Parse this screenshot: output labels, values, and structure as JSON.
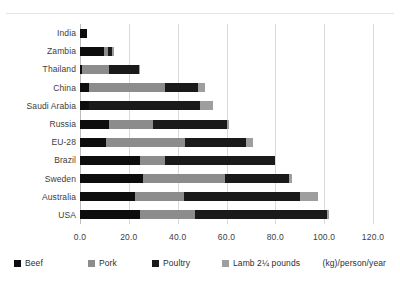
{
  "chart_data": {
    "type": "bar",
    "orientation": "horizontal",
    "stacked": true,
    "title": "",
    "subtitle": "",
    "xlabel": "(kg)/person/year",
    "ylabel": "",
    "xlim": [
      0,
      120
    ],
    "xticks": [
      "0.0",
      "20.0",
      "40.0",
      "60.0",
      "80.0",
      "100.0",
      "120.0"
    ],
    "xtick_values": [
      0,
      20,
      40,
      60,
      80,
      100,
      120
    ],
    "grid": true,
    "legend_position": "bottom",
    "categories": [
      "India",
      "Zambia",
      "Thailand",
      "China",
      "Saudi Arabia",
      "Russia",
      "EU-28",
      "Brazil",
      "Sweden",
      "Australia",
      "USA"
    ],
    "series": [
      {
        "name": "Beef",
        "color": "#0d0d0d",
        "values": [
          3.0,
          9.8,
          0.8,
          3.5,
          3.5,
          12.0,
          10.5,
          24.5,
          26.0,
          22.5,
          24.5
        ]
      },
      {
        "name": "Pork",
        "color": "#8c8c8c",
        "values": [
          0.0,
          1.6,
          11.2,
          31.5,
          0.0,
          18.0,
          32.5,
          10.5,
          33.5,
          20.0,
          22.5
        ]
      },
      {
        "name": "Poultry",
        "color": "#1a1a1a",
        "values": [
          0.0,
          1.8,
          12.0,
          13.5,
          45.5,
          30.0,
          25.0,
          45.0,
          26.0,
          47.5,
          54.0
        ]
      },
      {
        "name": "Lamb 2¼ pounds",
        "color": "#9e9e9e",
        "values": [
          0.0,
          0.6,
          0.5,
          2.5,
          5.5,
          1.0,
          3.0,
          0.0,
          1.5,
          7.5,
          1.0
        ]
      }
    ],
    "totals": [
      3.0,
      13.8,
      24.5,
      51.0,
      54.5,
      61.0,
      71.0,
      80.0,
      87.0,
      97.5,
      102.0
    ]
  },
  "legend": {
    "items": [
      {
        "label": "Beef",
        "color": "#0d0d0d"
      },
      {
        "label": "Pork",
        "color": "#8c8c8c"
      },
      {
        "label": "Poultry",
        "color": "#1a1a1a"
      },
      {
        "label": "Lamb 2¼ pounds",
        "color": "#9e9e9e"
      }
    ],
    "units_label": "(kg)/person/year"
  }
}
